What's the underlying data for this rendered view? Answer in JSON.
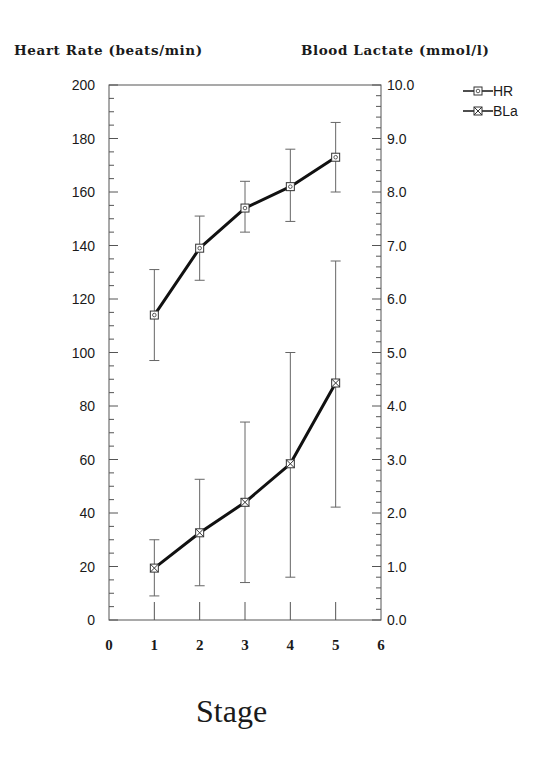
{
  "chart_data": {
    "type": "line",
    "title": "",
    "xlabel": "Stage",
    "ylabel": "Heart Rate (beats/min)",
    "y2label": "Blood Lactate (mmol/l)",
    "x": [
      1,
      2,
      3,
      4,
      5
    ],
    "xlim": [
      0,
      6
    ],
    "xticks": [
      0,
      1,
      2,
      3,
      4,
      5,
      6
    ],
    "ylim": [
      0,
      200
    ],
    "yticks": [
      0,
      20,
      40,
      60,
      80,
      100,
      120,
      140,
      160,
      180,
      200
    ],
    "y2lim": [
      0.0,
      10.0
    ],
    "y2ticks": [
      "0.0",
      "1.0",
      "2.0",
      "3.0",
      "4.0",
      "5.0",
      "6.0",
      "7.0",
      "8.0",
      "9.0",
      "10.0"
    ],
    "grid": false,
    "legend_position": "top-right outside",
    "series": [
      {
        "name": "HR",
        "axis": "left",
        "marker": "square-with-circle",
        "values": [
          114,
          139,
          154,
          162,
          173
        ],
        "error_upper": [
          131,
          151,
          164,
          176,
          186
        ],
        "error_lower": [
          97,
          127,
          145,
          149,
          160
        ]
      },
      {
        "name": "BLa",
        "axis": "right",
        "marker": "square-with-cross",
        "values": [
          0.97,
          1.63,
          2.2,
          2.92,
          4.43
        ],
        "error_upper": [
          1.5,
          2.63,
          3.7,
          5.0,
          6.71
        ],
        "error_lower": [
          0.45,
          0.64,
          0.7,
          0.8,
          2.11
        ]
      }
    ]
  },
  "labels": {
    "left_axis_title": "Heart Rate (beats/min)",
    "right_axis_title": "Blood Lactate (mmol/l)",
    "x_axis_title": "Stage",
    "legend": [
      "HR",
      "BLa"
    ]
  }
}
